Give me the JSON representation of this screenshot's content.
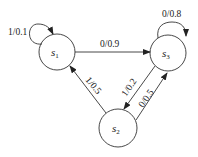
{
  "diagram": {
    "type": "state-transition",
    "states": [
      {
        "id": "s1",
        "name": "s",
        "sub": "1"
      },
      {
        "id": "s2",
        "name": "s",
        "sub": "2"
      },
      {
        "id": "s3",
        "name": "s",
        "sub": "3"
      }
    ],
    "transitions": [
      {
        "from": "s1",
        "to": "s1",
        "label": "1/0.1"
      },
      {
        "from": "s1",
        "to": "s3",
        "label": "0/0.9"
      },
      {
        "from": "s3",
        "to": "s3",
        "label": "0/0.8"
      },
      {
        "from": "s3",
        "to": "s2",
        "label": "1/0.2"
      },
      {
        "from": "s2",
        "to": "s3",
        "label": "0/0.5"
      },
      {
        "from": "s2",
        "to": "s1",
        "label": "1/0.5"
      }
    ]
  }
}
